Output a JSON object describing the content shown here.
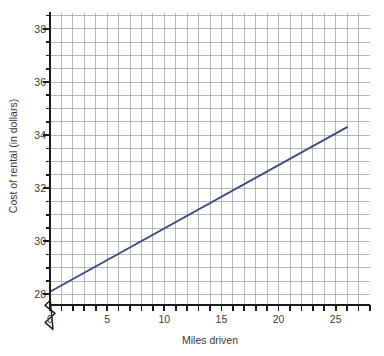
{
  "chart_data": {
    "type": "line",
    "title": "",
    "xlabel": "Miles driven",
    "ylabel": "Cost of rental (in dollars)",
    "xlim": [
      0,
      28
    ],
    "ylim": [
      27.6,
      38.6
    ],
    "y_axis_break": true,
    "y_axis_break_note": "zigzag break on vertical axis below 28",
    "grid": true,
    "grid_minor_x_step": 1,
    "grid_minor_y_step": 0.5,
    "legend": "none",
    "x_tick_labels": [
      "0",
      "5",
      "10",
      "15",
      "20",
      "25"
    ],
    "x_tick_values": [
      0,
      5,
      10,
      15,
      20,
      25
    ],
    "x_minor_tick_step": 1,
    "y_tick_labels": [
      "28",
      "30",
      "32",
      "34",
      "36",
      "38"
    ],
    "y_tick_values": [
      28,
      30,
      32,
      34,
      36,
      38
    ],
    "y_minor_tick_step": 0.5,
    "series": [
      {
        "name": "Cost of rental",
        "color": "#3a4a7a",
        "line_width": 1.8,
        "x": [
          0,
          26
        ],
        "values": [
          28.1,
          34.3
        ],
        "slope_per_mile": 0.238,
        "intercept": 28.1,
        "points": [
          {
            "x": 0,
            "y": 28.1
          },
          {
            "x": 5,
            "y": 29.3
          },
          {
            "x": 10,
            "y": 30.5
          },
          {
            "x": 15,
            "y": 31.7
          },
          {
            "x": 20,
            "y": 32.9
          },
          {
            "x": 26,
            "y": 34.3
          }
        ]
      }
    ]
  },
  "axis": {
    "line_color": "#1a1a1a",
    "grid_color": "#9a9a9a",
    "text_color": "#3a3a3a"
  }
}
